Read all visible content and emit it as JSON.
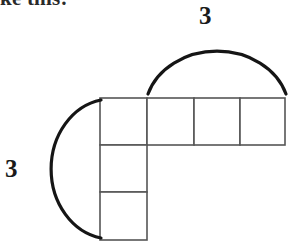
{
  "figure": {
    "caption_partial": "like this:",
    "background_color": "#ffffff",
    "width": 293,
    "height": 243
  },
  "shape": {
    "name": "L-shaped polyomino",
    "cell_size": 46,
    "grid_origin": {
      "x": 100,
      "y": 98
    },
    "line_color": "#565656",
    "cells": [
      {
        "id": "cell-r0c0",
        "row": 0,
        "col": 0,
        "x": 100,
        "y": 98,
        "w": 47,
        "h": 47
      },
      {
        "id": "cell-r0c1",
        "row": 0,
        "col": 1,
        "x": 147,
        "y": 98,
        "w": 47,
        "h": 47
      },
      {
        "id": "cell-r0c2",
        "row": 0,
        "col": 2,
        "x": 194,
        "y": 98,
        "w": 46,
        "h": 47
      },
      {
        "id": "cell-r0c3",
        "row": 0,
        "col": 3,
        "x": 240,
        "y": 98,
        "w": 45,
        "h": 47
      },
      {
        "id": "cell-r1c0",
        "row": 1,
        "col": 0,
        "x": 100,
        "y": 145,
        "w": 47,
        "h": 47
      },
      {
        "id": "cell-r2c0",
        "row": 2,
        "col": 0,
        "x": 100,
        "y": 192,
        "w": 47,
        "h": 48
      }
    ]
  },
  "braces": [
    {
      "id": "brace-top",
      "orientation": "horizontal",
      "label": "3",
      "color": "#151515",
      "path": "M 148 94 A 72 60 0 0 1 286 94",
      "spans_cells": 3
    },
    {
      "id": "brace-left",
      "orientation": "vertical",
      "label": "3",
      "color": "#151515",
      "path": "M 101 100 A 60 70 0 0 0 101 238",
      "spans_cells": 3
    }
  ],
  "labels": {
    "top_dimension": "3",
    "left_dimension": "3"
  }
}
